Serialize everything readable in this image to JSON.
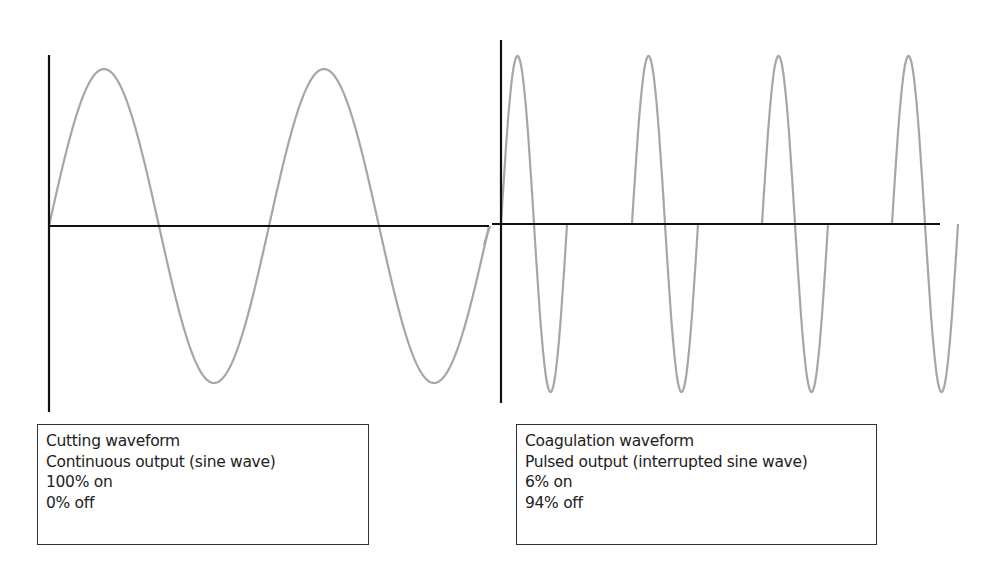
{
  "chart_data": [
    {
      "type": "line",
      "title": "Cutting waveform",
      "description": "Continuous output (sine wave)",
      "duty_on": "100% on",
      "duty_off": "0% off",
      "series": [
        {
          "name": "cutting",
          "shape": "continuous sine",
          "cycles": 2,
          "amplitude": 1
        }
      ],
      "axes": {
        "x": "time",
        "y": "amplitude",
        "grid": false,
        "ticks": false
      },
      "line_color": "#a6a6a6",
      "axis_color": "#111111"
    },
    {
      "type": "line",
      "title": "Coagulation waveform",
      "description": "Pulsed output (interrupted sine wave)",
      "duty_on": "6% on",
      "duty_off": "94% off",
      "series": [
        {
          "name": "coagulation",
          "shape": "interrupted sine bursts",
          "bursts": 4,
          "cycles_per_burst": 1,
          "amplitude": 1
        }
      ],
      "axes": {
        "x": "time",
        "y": "amplitude",
        "grid": false,
        "ticks": false
      },
      "line_color": "#a6a6a6",
      "axis_color": "#111111"
    }
  ],
  "captions": {
    "cutting": {
      "line1": "Cutting waveform",
      "line2": "Continuous output (sine wave)",
      "line3": "100% on",
      "line4": "0% off"
    },
    "coagulation": {
      "line1": "Coagulation waveform",
      "line2": "Pulsed output (interrupted sine wave)",
      "line3": "6% on",
      "line4": "94% off"
    }
  }
}
